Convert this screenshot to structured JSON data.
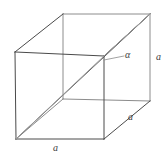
{
  "figure": {
    "type": "geometry-diagram",
    "shape": "cube",
    "line_color": "#4a4a4a",
    "diagonal_color": "#5a5a5a",
    "background_color": "#ffffff",
    "labels": {
      "edge_bottom_front": "a",
      "edge_bottom_depth": "a",
      "edge_right_vertical": "a",
      "angle": "α"
    },
    "vertices": {
      "front_top_left": [
        15,
        52
      ],
      "front_top_right": [
        104,
        56
      ],
      "front_bottom_right": [
        104,
        139
      ],
      "front_bottom_left": [
        16,
        139
      ],
      "back_top_left": [
        63,
        14
      ],
      "back_top_right": [
        150,
        14
      ],
      "back_bottom_right": [
        150,
        101
      ],
      "back_bottom_left": [
        63,
        99
      ]
    },
    "diagonals": [
      {
        "name": "space-diagonal",
        "from": "front_bottom_left",
        "to": "back_top_right"
      },
      {
        "name": "face-diagonal",
        "from": "front_bottom_left",
        "to": "front_top_right"
      }
    ]
  }
}
